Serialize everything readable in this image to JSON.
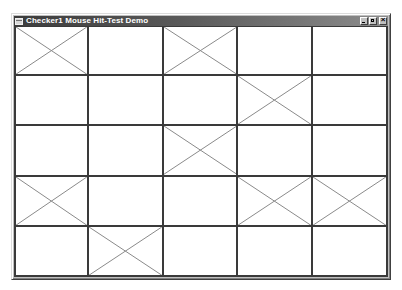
{
  "window": {
    "title": "Checker1 Mouse Hit-Test Demo",
    "icon": "app-window-icon",
    "caption_buttons": [
      {
        "name": "minimize",
        "icon": "minimize-icon"
      },
      {
        "name": "maximize",
        "icon": "maximize-icon"
      },
      {
        "name": "close",
        "icon": "close-icon"
      }
    ]
  },
  "grid": {
    "rows": 5,
    "cols": 5,
    "line_color": "#3a3a3a",
    "x_mark_color": "#8a8a8a",
    "cells": [
      [
        true,
        false,
        true,
        false,
        false
      ],
      [
        false,
        false,
        false,
        true,
        false
      ],
      [
        false,
        false,
        true,
        false,
        false
      ],
      [
        true,
        false,
        false,
        true,
        true
      ],
      [
        false,
        true,
        false,
        false,
        false
      ]
    ]
  }
}
